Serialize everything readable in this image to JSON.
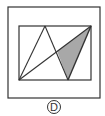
{
  "figure": {
    "option_label": "D",
    "colors": {
      "stroke": "#333333",
      "shaded_fill": "#a8a8a8",
      "background": "#ffffff"
    },
    "outer_frame": {
      "x": 8,
      "y": 7,
      "w": 92,
      "h": 91
    },
    "inner_rect": {
      "x": 19,
      "y": 26,
      "w": 72,
      "h": 54
    },
    "lines": [
      {
        "from": [
          19,
          80
        ],
        "to": [
          45,
          26
        ]
      },
      {
        "from": [
          45,
          26
        ],
        "to": [
          68,
          80
        ]
      },
      {
        "from": [
          19,
          80
        ],
        "to": [
          91,
          26
        ]
      },
      {
        "from": [
          91,
          26
        ],
        "to": [
          68,
          80
        ]
      }
    ],
    "shaded_region": [
      [
        91,
        26
      ],
      [
        68,
        80
      ],
      [
        57,
        51
      ]
    ]
  }
}
